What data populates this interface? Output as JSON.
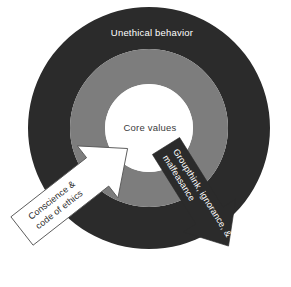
{
  "diagram": {
    "type": "concentric-ring-cycle",
    "background_color": "#ffffff",
    "rings": [
      {
        "name": "outer-ring",
        "label": "Unethical behavior",
        "fill_color": "#2b2b2b",
        "text_color": "#ffffff",
        "outer_radius": 121,
        "inner_radius": 79
      },
      {
        "name": "middle-ring",
        "label": "",
        "fill_color": "#7d7d7d",
        "text_color": "#ffffff",
        "outer_radius": 79,
        "inner_radius": 44
      },
      {
        "name": "core-circle",
        "label": "Core values",
        "fill_color": "#ffffff",
        "text_color": "#3b3b3b",
        "outer_radius": 44,
        "inner_radius": 0
      }
    ],
    "center": {
      "x": 149,
      "y": 128
    },
    "arrows": [
      {
        "name": "inward-arrow",
        "label_lines": [
          "Conscience &",
          "code of ethics"
        ],
        "fill_color": "#ffffff",
        "stroke_color": "#555555",
        "text_color": "#2b2b2b",
        "direction": "up-right",
        "rotation_deg": -38
      },
      {
        "name": "outward-arrow",
        "label_lines": [
          "Groupthink, ignorance, &",
          "malfeasance"
        ],
        "fill_color": "#2b2b2b",
        "stroke_color": "#2b2b2b",
        "text_color": "#ffffff",
        "direction": "down-right",
        "rotation_deg": 58
      }
    ]
  }
}
